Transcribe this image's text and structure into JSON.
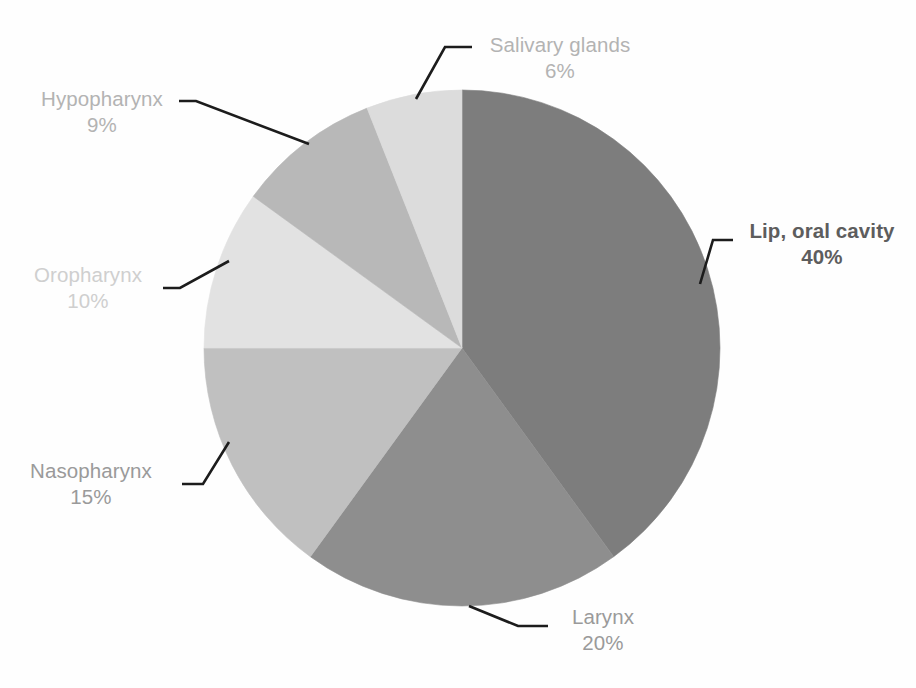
{
  "chart_data": {
    "type": "pie",
    "title": "",
    "total_label": "",
    "unit": "%",
    "center": {
      "x": 462,
      "y": 348
    },
    "radius": 258,
    "start_angle_deg": 0,
    "direction": "clockwise",
    "legend": "none (direct labels with leader lines)",
    "categories": [
      "Lip, oral cavity",
      "Larynx",
      "Nasopharynx",
      "Oropharynx",
      "Hypopharynx",
      "Salivary glands"
    ],
    "values": [
      40,
      20,
      15,
      10,
      9,
      6
    ],
    "slices": [
      {
        "name": "Lip, oral cavity",
        "label": "Lip, oral cavity",
        "value": 40,
        "percent_text": "40%",
        "color": "#7d7d7d",
        "start_deg": 0,
        "end_deg": 144,
        "label_color": "#5d5d5d",
        "label_weight": "bold"
      },
      {
        "name": "Larynx",
        "label": "Larynx",
        "value": 20,
        "percent_text": "20%",
        "color": "#8e8e8e",
        "start_deg": 144,
        "end_deg": 216,
        "label_color": "#9a9a9a",
        "label_weight": "normal"
      },
      {
        "name": "Nasopharynx",
        "label": "Nasopharynx",
        "value": 15,
        "percent_text": "15%",
        "color": "#c0c0c0",
        "start_deg": 216,
        "end_deg": 270,
        "label_color": "#9a9a9a",
        "label_weight": "normal"
      },
      {
        "name": "Oropharynx",
        "label": "Oropharynx",
        "value": 10,
        "percent_text": "10%",
        "color": "#e2e2e2",
        "start_deg": 270,
        "end_deg": 306,
        "label_color": "#cfcfcf",
        "label_weight": "normal"
      },
      {
        "name": "Hypopharynx",
        "label": "Hypopharynx",
        "value": 9,
        "percent_text": "9%",
        "color": "#b8b8b8",
        "start_deg": 306,
        "end_deg": 338.4,
        "label_color": "#b3b3b3",
        "label_weight": "normal"
      },
      {
        "name": "Salivary glands",
        "label": "Salivary glands",
        "value": 6,
        "percent_text": "6%",
        "color": "#dcdcdc",
        "start_deg": 338.4,
        "end_deg": 360,
        "label_color": "#b3b3b3",
        "label_weight": "normal"
      }
    ],
    "background_color": "#fefefe",
    "leader_line_color": "#1c1c1c"
  },
  "labels": {
    "salivary": {
      "name": "Salivary glands",
      "pct": "6%"
    },
    "hypopharynx": {
      "name": "Hypopharynx",
      "pct": "9%"
    },
    "oropharynx": {
      "name": "Oropharynx",
      "pct": "10%"
    },
    "nasopharynx": {
      "name": "Nasopharynx",
      "pct": "15%"
    },
    "larynx": {
      "name": "Larynx",
      "pct": "20%"
    },
    "lip": {
      "name": "Lip, oral cavity",
      "pct": "40%"
    }
  }
}
